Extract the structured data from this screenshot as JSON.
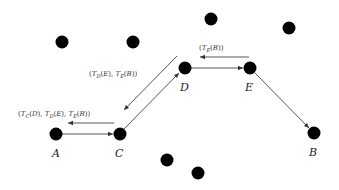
{
  "diagram": {
    "type": "network-path",
    "nodes": [
      {
        "id": "A",
        "label": "A",
        "x": 56,
        "y": 134,
        "labeled": true
      },
      {
        "id": "C",
        "label": "C",
        "x": 120,
        "y": 134,
        "labeled": true
      },
      {
        "id": "D",
        "label": "D",
        "x": 185,
        "y": 68,
        "labeled": true
      },
      {
        "id": "E",
        "label": "E",
        "x": 250,
        "y": 68,
        "labeled": true
      },
      {
        "id": "B",
        "label": "B",
        "x": 314,
        "y": 133,
        "labeled": true
      },
      {
        "id": "n1",
        "label": "",
        "x": 62,
        "y": 42,
        "labeled": false
      },
      {
        "id": "n2",
        "label": "",
        "x": 133,
        "y": 42,
        "labeled": false
      },
      {
        "id": "n3",
        "label": "",
        "x": 211,
        "y": 19,
        "labeled": false
      },
      {
        "id": "n4",
        "label": "",
        "x": 289,
        "y": 28,
        "labeled": false
      },
      {
        "id": "n5",
        "label": "",
        "x": 167,
        "y": 160,
        "labeled": false
      },
      {
        "id": "n6",
        "label": "",
        "x": 198,
        "y": 173,
        "labeled": false
      }
    ],
    "forward_path": [
      "A",
      "C",
      "D",
      "E",
      "B"
    ],
    "messages": [
      {
        "text": "(T_E(B))",
        "parts": {
          "open": "(",
          "T": "T",
          "sub": "E",
          "arg": "(B))"
        },
        "from": "E",
        "to": "D"
      },
      {
        "text": "(T_D(E), T_E(B))",
        "parts": [
          "(T",
          "D",
          "(E), T",
          "E",
          "(B))"
        ],
        "from": "D",
        "to": "C"
      },
      {
        "text": "(T_C(D), T_D(E), T_E(B))",
        "parts": [
          "(T",
          "C",
          "(D), T",
          "D",
          "(E), T",
          "E",
          "(B))"
        ],
        "from": "C",
        "to": "A"
      }
    ],
    "colors": {
      "node": "#000000",
      "edge": "#444444",
      "text": "#222222",
      "background": "#ffffff"
    }
  }
}
